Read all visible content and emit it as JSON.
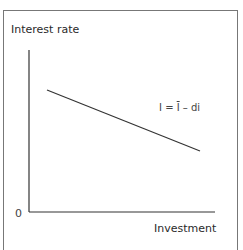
{
  "figure": {
    "y_axis_label": "Interest rate",
    "x_axis_label": "Investment",
    "origin_label": "0",
    "curve_label": {
      "lhs": "I = ",
      "bar_term": "I",
      "rhs": " – di"
    }
  }
}
